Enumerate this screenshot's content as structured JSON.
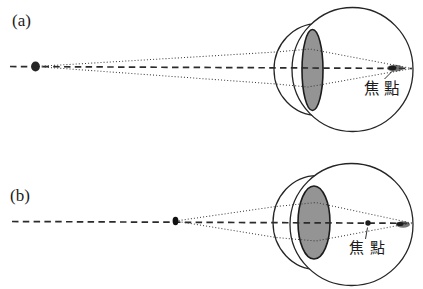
{
  "colors": {
    "stroke": "#252525",
    "lens_fill": "#949494",
    "background": "#ffffff"
  },
  "panel_a": {
    "label": "(a)",
    "focal_point_label": "焦點"
  },
  "panel_b": {
    "label": "(b)",
    "focal_point_label": "焦點"
  }
}
